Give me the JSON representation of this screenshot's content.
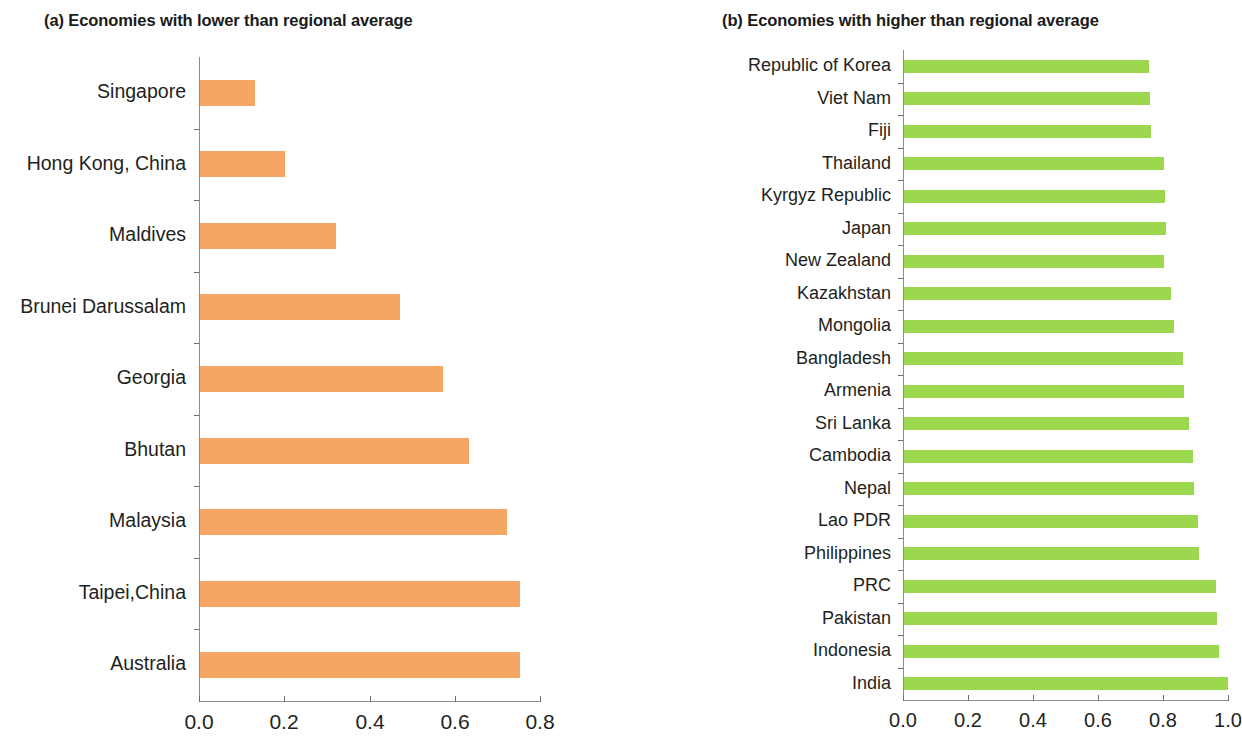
{
  "chart_data": [
    {
      "type": "bar",
      "orientation": "horizontal",
      "panel": "a",
      "title": "(a) Economies with lower than regional average",
      "xlabel": "",
      "ylabel": "",
      "xlim": [
        0.0,
        0.8
      ],
      "xticks": [
        0.0,
        0.2,
        0.4,
        0.6,
        0.8
      ],
      "xtick_labels": [
        "0.0",
        "0.2",
        "0.4",
        "0.6",
        "0.8"
      ],
      "grid": false,
      "legend": "none",
      "color": "#f5a663",
      "categories": [
        "Singapore",
        "Hong Kong, China",
        "Maldives",
        "Brunei Darussalam",
        "Georgia",
        "Bhutan",
        "Malaysia",
        "Taipei,China",
        "Australia"
      ],
      "values": [
        0.13,
        0.2,
        0.32,
        0.47,
        0.57,
        0.63,
        0.72,
        0.75,
        0.75
      ]
    },
    {
      "type": "bar",
      "orientation": "horizontal",
      "panel": "b",
      "title": "(b) Economies with higher than regional average",
      "xlabel": "",
      "ylabel": "",
      "xlim": [
        0.0,
        1.0
      ],
      "xticks": [
        0.0,
        0.2,
        0.4,
        0.6,
        0.8,
        1.0
      ],
      "xtick_labels": [
        "0.0",
        "0.2",
        "0.4",
        "0.6",
        "0.8",
        "1.0"
      ],
      "grid": false,
      "legend": "none",
      "color": "#9bd84e",
      "categories": [
        "Republic of Korea",
        "Viet Nam",
        "Fiji",
        "Thailand",
        "Kyrgyz Republic",
        "Japan",
        "New Zealand",
        "Kazakhstan",
        "Mongolia",
        "Bangladesh",
        "Armenia",
        "Sri Lanka",
        "Cambodia",
        "Nepal",
        "Lao PDR",
        "Philippines",
        "PRC",
        "Pakistan",
        "Indonesia",
        "India"
      ],
      "values": [
        0.755,
        0.758,
        0.76,
        0.8,
        0.803,
        0.806,
        0.8,
        0.822,
        0.831,
        0.858,
        0.862,
        0.877,
        0.889,
        0.892,
        0.904,
        0.908,
        0.96,
        0.963,
        0.969,
        0.997
      ]
    }
  ],
  "colors": {
    "orange": "#f5a663",
    "green": "#9bd84e",
    "axis": "#8d8d8d",
    "text": "#231f20",
    "background": "#ffffff"
  }
}
